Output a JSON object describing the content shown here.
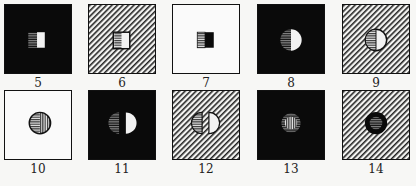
{
  "figure": {
    "panels": [
      {
        "id": "5",
        "label": "5",
        "background": "black",
        "figure": "square-split",
        "left_fill": "horizontal-stripes",
        "right_fill": "white"
      },
      {
        "id": "6",
        "label": "6",
        "background": "hatched",
        "figure": "square-split",
        "left_fill": "horizontal-stripes",
        "right_fill": "white"
      },
      {
        "id": "7",
        "label": "7",
        "background": "white",
        "figure": "square-split",
        "left_fill": "horizontal-stripes",
        "right_fill": "black"
      },
      {
        "id": "8",
        "label": "8",
        "background": "black",
        "figure": "circle-split",
        "left_fill": "horizontal-stripes",
        "right_fill": "white"
      },
      {
        "id": "9",
        "label": "9",
        "background": "hatched",
        "figure": "circle-split",
        "left_fill": "horizontal-stripes",
        "right_fill": "white"
      },
      {
        "id": "10",
        "label": "10",
        "background": "white",
        "figure": "circle-split",
        "left_fill": "horizontal-stripes",
        "right_fill": "vertical-stripes"
      },
      {
        "id": "11",
        "label": "11",
        "background": "black",
        "figure": "circle-separated",
        "left_fill": "horizontal-stripes",
        "right_fill": "white"
      },
      {
        "id": "12",
        "label": "12",
        "background": "hatched",
        "figure": "circle-separated",
        "left_fill": "horizontal-stripes",
        "right_fill": "white"
      },
      {
        "id": "13",
        "label": "13",
        "background": "black",
        "figure": "circle-ring",
        "ring_fill": "horizontal-stripes",
        "center_fill": "vertical-stripes"
      },
      {
        "id": "14",
        "label": "14",
        "background": "hatched",
        "figure": "circle-ring",
        "ring_fill": "black",
        "center_fill": "horizontal-stripes"
      }
    ],
    "colors": {
      "ink": "#111111",
      "paper": "#f7f7f5",
      "stripe_gray": "#777777"
    }
  }
}
